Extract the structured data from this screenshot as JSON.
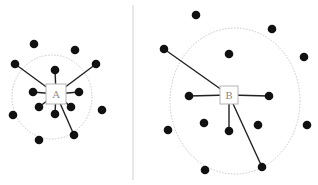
{
  "diagram": {
    "colors": {
      "dot": "#111111",
      "edge": "#222222",
      "boundary": "#c8c8c8",
      "box_stroke": "#b5b5b5",
      "label": "#8a8a8a",
      "divider": "#d0d0d0"
    },
    "panels": [
      {
        "label": "A",
        "center": [
          56,
          94
        ],
        "box_size": 20,
        "boundary": {
          "cx": 52,
          "cy": 97,
          "rx": 40,
          "ry": 42
        },
        "points": [
          [
            34,
            44
          ],
          [
            75,
            50
          ],
          [
            15,
            64
          ],
          [
            96,
            64
          ],
          [
            55,
            70
          ],
          [
            33,
            92
          ],
          [
            79,
            92
          ],
          [
            39,
            107
          ],
          [
            71,
            107
          ],
          [
            102,
            110
          ],
          [
            13,
            115
          ],
          [
            55,
            114
          ],
          [
            74,
            135
          ],
          [
            39,
            140
          ]
        ],
        "connected": [
          [
            15,
            64
          ],
          [
            96,
            64
          ],
          [
            55,
            70
          ],
          [
            33,
            92
          ],
          [
            79,
            92
          ],
          [
            39,
            107
          ],
          [
            71,
            107
          ],
          [
            55,
            114
          ],
          [
            74,
            135
          ]
        ]
      },
      {
        "label": "B",
        "center": [
          229,
          95
        ],
        "box_size": 18,
        "boundary": {
          "cx": 235,
          "cy": 101,
          "rx": 65,
          "ry": 73
        },
        "points": [
          [
            196,
            15
          ],
          [
            272,
            29
          ],
          [
            164,
            49
          ],
          [
            229,
            54
          ],
          [
            304,
            57
          ],
          [
            189,
            96
          ],
          [
            269,
            96
          ],
          [
            204,
            123
          ],
          [
            258,
            125
          ],
          [
            307,
            125
          ],
          [
            168,
            130
          ],
          [
            229,
            131
          ],
          [
            262,
            167
          ],
          [
            205,
            170
          ]
        ],
        "connected": [
          [
            164,
            49
          ],
          [
            189,
            96
          ],
          [
            269,
            96
          ],
          [
            229,
            131
          ],
          [
            262,
            167
          ]
        ]
      }
    ],
    "divider": {
      "x": 133,
      "y1": 5,
      "y2": 180
    }
  }
}
